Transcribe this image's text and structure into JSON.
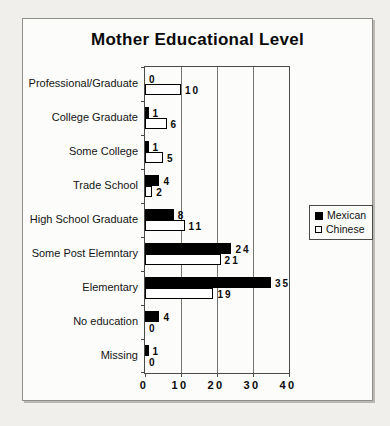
{
  "page": {
    "paper_color": "#f0efec",
    "chart_background": "#fcfcfa"
  },
  "chart_data": {
    "type": "bar",
    "orientation": "horizontal",
    "title": "Mother Educational Level",
    "categories": [
      "Professional/Graduate",
      "College Graduate",
      "Some College",
      "Trade School",
      "High School Graduate",
      "Some Post Elemntary",
      "Elementary",
      "No education",
      "Missing"
    ],
    "series": [
      {
        "name": "Mexican",
        "swatch": "filled-black-square",
        "color": "#000000",
        "values": [
          0,
          1,
          1,
          4,
          8,
          24,
          35,
          4,
          1
        ]
      },
      {
        "name": "Chinese",
        "swatch": "open-white-square",
        "color": "#ffffff",
        "border_color": "#000000",
        "values": [
          10,
          6,
          5,
          2,
          11,
          21,
          19,
          0,
          0
        ]
      }
    ],
    "xlabel": "",
    "ylabel": "",
    "xlim": [
      0,
      40
    ],
    "x_ticks": [
      0,
      10,
      20,
      30,
      40
    ],
    "grid": true,
    "data_labels": true,
    "legend_position": "right-middle"
  }
}
